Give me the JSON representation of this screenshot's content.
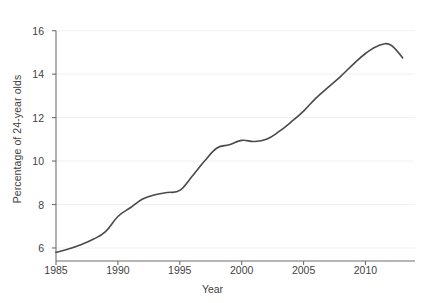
{
  "chart_data": {
    "type": "line",
    "title": "",
    "subtitle": "",
    "xlabel": "Year",
    "ylabel": "Percentage of 24-year olds",
    "xlim": [
      1985,
      2014
    ],
    "ylim": [
      5.4,
      16.4
    ],
    "xticks": [
      1985,
      1990,
      1995,
      2000,
      2005,
      2010
    ],
    "yticks": [
      6,
      8,
      10,
      12,
      14,
      16
    ],
    "xtick_labels": [
      "1985",
      "1990",
      "1995",
      "2000",
      "2005",
      "2010"
    ],
    "ytick_labels": [
      "6",
      "8",
      "10",
      "12",
      "14",
      "16"
    ],
    "grid": "horizontal-faint",
    "legend": "none",
    "line_color": "#4a4a4a",
    "line_width": 1.6,
    "axis_color": "#6e6e6e",
    "grid_color": "#f0f0f0",
    "background": "#ffffff",
    "series": [
      {
        "name": "Percentage of 24-year olds",
        "x": [
          1985,
          1986,
          1987,
          1988,
          1989,
          1990,
          1991,
          1992,
          1993,
          1994,
          1995,
          1996,
          1997,
          1998,
          1999,
          2000,
          2001,
          2002,
          2003,
          2004,
          2005,
          2006,
          2007,
          2008,
          2009,
          2010,
          2011,
          2012,
          2013
        ],
        "values": [
          5.8,
          5.95,
          6.15,
          6.4,
          6.75,
          7.45,
          7.85,
          8.25,
          8.45,
          8.55,
          8.65,
          9.3,
          10.0,
          10.6,
          10.75,
          10.95,
          10.9,
          11.0,
          11.35,
          11.8,
          12.3,
          12.9,
          13.4,
          13.9,
          14.45,
          14.95,
          15.3,
          15.35,
          14.75
        ]
      }
    ],
    "annotations": []
  },
  "axes": {
    "ylabel": "Percentage of 24-year olds",
    "xlabel": "Year"
  },
  "caption": {
    "text": ""
  }
}
